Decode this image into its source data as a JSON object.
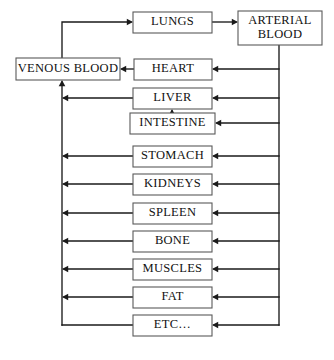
{
  "diagram": {
    "background_color": "#ffffff",
    "line_color": "#1a1a1a",
    "box_border_color": "#5a5a5a",
    "box_fill_color": "#ffffff",
    "text_color": "#111111",
    "nodes": [
      {
        "id": "lungs",
        "label": "LUNGS",
        "lines": [
          "LUNGS"
        ],
        "x": 133,
        "y": 12,
        "w": 79,
        "h": 21,
        "font_size": 12.5
      },
      {
        "id": "arterial_blood",
        "label": "ARTERIAL BLOOD",
        "lines": [
          "ARTERIAL",
          "BLOOD"
        ],
        "x": 238,
        "y": 11,
        "w": 84,
        "h": 34,
        "font_size": 12.5
      },
      {
        "id": "venous_blood",
        "label": "VENOUS BLOOD",
        "lines": [
          "VENOUS BLOOD"
        ],
        "x": 16,
        "y": 58,
        "w": 104,
        "h": 22,
        "font_size": 12.5
      },
      {
        "id": "heart",
        "label": "HEART",
        "lines": [
          "HEART"
        ],
        "x": 134,
        "y": 59,
        "w": 78,
        "h": 21,
        "font_size": 12.5
      },
      {
        "id": "liver",
        "label": "LIVER",
        "lines": [
          "LIVER"
        ],
        "x": 133,
        "y": 88,
        "w": 79,
        "h": 21,
        "font_size": 12.5
      },
      {
        "id": "intestine",
        "label": "INTESTINE",
        "lines": [
          "INTESTINE"
        ],
        "x": 130,
        "y": 113,
        "w": 85,
        "h": 21,
        "font_size": 12.5
      },
      {
        "id": "stomach",
        "label": "STOMACH",
        "lines": [
          "STOMACH"
        ],
        "x": 133,
        "y": 146,
        "w": 79,
        "h": 21,
        "font_size": 12.5
      },
      {
        "id": "kidneys",
        "label": "KIDNEYS",
        "lines": [
          "KIDNEYS"
        ],
        "x": 133,
        "y": 174,
        "w": 79,
        "h": 21,
        "font_size": 12.5
      },
      {
        "id": "spleen",
        "label": "SPLEEN",
        "lines": [
          "SPLEEN"
        ],
        "x": 133,
        "y": 203,
        "w": 79,
        "h": 21,
        "font_size": 12.5
      },
      {
        "id": "bone",
        "label": "BONE",
        "lines": [
          "BONE"
        ],
        "x": 133,
        "y": 231,
        "w": 79,
        "h": 21,
        "font_size": 12.5
      },
      {
        "id": "muscles",
        "label": "MUSCLES",
        "lines": [
          "MUSCLES"
        ],
        "x": 133,
        "y": 259,
        "w": 79,
        "h": 21,
        "font_size": 12.5
      },
      {
        "id": "fat",
        "label": "FAT",
        "lines": [
          "FAT"
        ],
        "x": 133,
        "y": 287,
        "w": 79,
        "h": 21,
        "font_size": 12.5
      },
      {
        "id": "etc",
        "label": "ETC…",
        "lines": [
          "ETC…"
        ],
        "x": 133,
        "y": 315,
        "w": 79,
        "h": 21,
        "font_size": 12.5
      }
    ],
    "trunks": {
      "left_x": 62,
      "right_x": 279,
      "top_feed_y": 22
    },
    "connections": [
      {
        "id": "venous-to-lungs",
        "from": "venous_blood",
        "to": "lungs",
        "points": "62,58 62,22 131,22",
        "arrow": {
          "x": 133,
          "y": 22,
          "dir": "right"
        }
      },
      {
        "id": "lungs-to-arterial",
        "from": "lungs",
        "to": "arterial_blood",
        "points": "212,22 236,22",
        "arrow": {
          "x": 238,
          "y": 22,
          "dir": "right"
        }
      },
      {
        "id": "arterial-trunk-down",
        "from": "arterial_blood",
        "to": "right-trunk",
        "points": "279,45 279,325",
        "arrow": null
      },
      {
        "id": "arterial-to-heart",
        "from": "arterial_blood",
        "to": "heart",
        "points": "279,69 214,69",
        "arrow": {
          "x": 212,
          "y": 69,
          "dir": "left"
        }
      },
      {
        "id": "arterial-to-liver",
        "from": "arterial_blood",
        "to": "liver",
        "points": "279,98 214,98",
        "arrow": {
          "x": 212,
          "y": 98,
          "dir": "left"
        }
      },
      {
        "id": "arterial-to-intestine",
        "from": "arterial_blood",
        "to": "intestine",
        "points": "279,123 217,123",
        "arrow": {
          "x": 215,
          "y": 123,
          "dir": "left"
        }
      },
      {
        "id": "arterial-to-stomach",
        "from": "arterial_blood",
        "to": "stomach",
        "points": "279,156 214,156",
        "arrow": {
          "x": 212,
          "y": 156,
          "dir": "left"
        }
      },
      {
        "id": "arterial-to-kidneys",
        "from": "arterial_blood",
        "to": "kidneys",
        "points": "279,184 214,184",
        "arrow": {
          "x": 212,
          "y": 184,
          "dir": "left"
        }
      },
      {
        "id": "arterial-to-spleen",
        "from": "arterial_blood",
        "to": "spleen",
        "points": "279,213 214,213",
        "arrow": {
          "x": 212,
          "y": 213,
          "dir": "left"
        }
      },
      {
        "id": "arterial-to-bone",
        "from": "arterial_blood",
        "to": "bone",
        "points": "279,241 214,241",
        "arrow": {
          "x": 212,
          "y": 241,
          "dir": "left"
        }
      },
      {
        "id": "arterial-to-muscles",
        "from": "arterial_blood",
        "to": "muscles",
        "points": "279,269 214,269",
        "arrow": {
          "x": 212,
          "y": 269,
          "dir": "left"
        }
      },
      {
        "id": "arterial-to-fat",
        "from": "arterial_blood",
        "to": "fat",
        "points": "279,297 214,297",
        "arrow": {
          "x": 212,
          "y": 297,
          "dir": "left"
        }
      },
      {
        "id": "arterial-to-etc",
        "from": "arterial_blood",
        "to": "etc",
        "points": "279,325 214,325",
        "arrow": {
          "x": 212,
          "y": 325,
          "dir": "left"
        }
      },
      {
        "id": "heart-to-venous",
        "from": "heart",
        "to": "venous_blood",
        "points": "134,69 122,69",
        "arrow": {
          "x": 120,
          "y": 69,
          "dir": "left"
        }
      },
      {
        "id": "left-trunk-up",
        "from": "left-trunk",
        "to": "venous_blood",
        "points": "62,325 62,82",
        "arrow": {
          "x": 62,
          "y": 80,
          "dir": "up"
        }
      },
      {
        "id": "liver-to-trunk",
        "from": "liver",
        "to": "left-trunk",
        "points": "133,98 64,98",
        "arrow": {
          "x": 62,
          "y": 98,
          "dir": "left"
        }
      },
      {
        "id": "intestine-to-liver",
        "from": "intestine",
        "to": "liver",
        "points": "172,113 172,111",
        "arrow": {
          "x": 172,
          "y": 109,
          "dir": "up"
        }
      },
      {
        "id": "stomach-to-trunk",
        "from": "stomach",
        "to": "left-trunk",
        "points": "133,156 64,156",
        "arrow": {
          "x": 62,
          "y": 156,
          "dir": "left"
        }
      },
      {
        "id": "kidneys-to-trunk",
        "from": "kidneys",
        "to": "left-trunk",
        "points": "133,184 64,184",
        "arrow": {
          "x": 62,
          "y": 184,
          "dir": "left"
        }
      },
      {
        "id": "spleen-to-trunk",
        "from": "spleen",
        "to": "left-trunk",
        "points": "133,213 64,213",
        "arrow": {
          "x": 62,
          "y": 213,
          "dir": "left"
        }
      },
      {
        "id": "bone-to-trunk",
        "from": "bone",
        "to": "left-trunk",
        "points": "133,241 64,241",
        "arrow": {
          "x": 62,
          "y": 241,
          "dir": "left"
        }
      },
      {
        "id": "muscles-to-trunk",
        "from": "muscles",
        "to": "left-trunk",
        "points": "133,269 64,269",
        "arrow": {
          "x": 62,
          "y": 269,
          "dir": "left"
        }
      },
      {
        "id": "fat-to-trunk",
        "from": "fat",
        "to": "left-trunk",
        "points": "133,297 64,297",
        "arrow": {
          "x": 62,
          "y": 297,
          "dir": "left"
        }
      },
      {
        "id": "etc-to-trunk",
        "from": "etc",
        "to": "left-trunk",
        "points": "133,325 62,325",
        "arrow": null
      }
    ]
  }
}
